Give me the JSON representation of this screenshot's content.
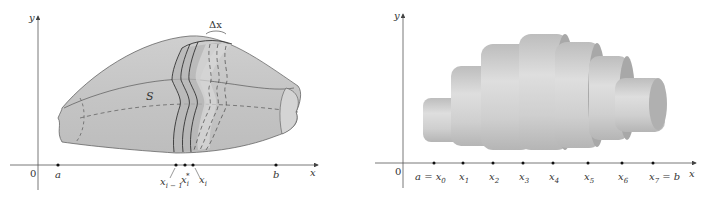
{
  "left_figure": {
    "axes": {
      "y_label": "y",
      "x_label": "x",
      "origin_label": "0"
    },
    "surface_label": "S",
    "width_label": "Δx",
    "points": [
      {
        "name": "a",
        "label": "a"
      },
      {
        "name": "x_i_minus_1",
        "label": "x",
        "sub": "i − 1"
      },
      {
        "name": "x_i_star",
        "label": "x",
        "sub": "i",
        "sup": "*"
      },
      {
        "name": "x_i",
        "label": "x",
        "sub": "i"
      },
      {
        "name": "b",
        "label": "b"
      }
    ]
  },
  "right_figure": {
    "axes": {
      "y_label": "y",
      "x_label": "x",
      "origin_label": "0"
    },
    "points": [
      {
        "label": "a = x",
        "sub": "0"
      },
      {
        "label": "x",
        "sub": "1"
      },
      {
        "label": "x",
        "sub": "2"
      },
      {
        "label": "x",
        "sub": "3"
      },
      {
        "label": "x",
        "sub": "4"
      },
      {
        "label": "x",
        "sub": "5"
      },
      {
        "label": "x",
        "sub": "6"
      },
      {
        "label": "x",
        "sub": "7",
        "suffix": " = b"
      }
    ]
  },
  "colors": {
    "solid_fill": "#c8c8c8",
    "solid_light": "#dcdcdc",
    "slab_dark": "#a9a9a9",
    "axis": "#555555",
    "outline": "#333333"
  }
}
